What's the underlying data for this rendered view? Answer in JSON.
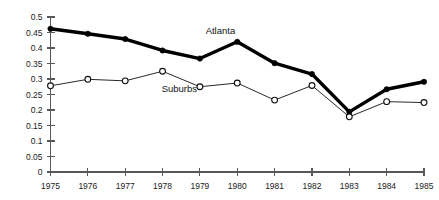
{
  "chart_data": {
    "type": "line",
    "title": "",
    "xlabel": "",
    "ylabel": "",
    "xlim": [
      1975,
      1985
    ],
    "ylim": [
      0,
      0.5
    ],
    "grid": false,
    "legend_position": "inline-annotation",
    "categories": [
      "1975",
      "1976",
      "1977",
      "1978",
      "1979",
      "1980",
      "1981",
      "1982",
      "1983",
      "1984",
      "1985"
    ],
    "x": [
      1975,
      1976,
      1977,
      1978,
      1979,
      1980,
      1981,
      1982,
      1983,
      1984,
      1985
    ],
    "ytick_labels": [
      "0",
      "0.05",
      "0.1",
      "0.15",
      "0.2",
      "0.25",
      "0.3",
      "0.35",
      "0.4",
      "0.45",
      "0.5"
    ],
    "ytick_values": [
      0,
      0.05,
      0.1,
      0.15,
      0.2,
      0.25,
      0.3,
      0.35,
      0.4,
      0.45,
      0.5
    ],
    "series": [
      {
        "name": "Atlanta",
        "marker": "filled-circle",
        "line_width": "thick",
        "color": "#000000",
        "label_x": 1979.55,
        "label_y": 0.445,
        "values": [
          0.462,
          0.446,
          0.429,
          0.392,
          0.366,
          0.42,
          0.351,
          0.316,
          0.194,
          0.267,
          0.291
        ]
      },
      {
        "name": "Suburbs",
        "marker": "open-circle",
        "line_width": "thin",
        "color": "#101010",
        "label_x": 1978.45,
        "label_y": 0.258,
        "values": [
          0.278,
          0.299,
          0.294,
          0.325,
          0.275,
          0.287,
          0.232,
          0.279,
          0.178,
          0.227,
          0.224
        ]
      }
    ]
  }
}
